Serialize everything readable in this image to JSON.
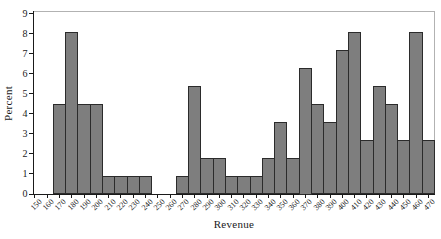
{
  "chart_data": {
    "type": "bar",
    "subtype": "histogram",
    "title": "",
    "xlabel": "Revenue",
    "ylabel": "Percent",
    "categories": [
      150,
      160,
      170,
      180,
      190,
      200,
      210,
      220,
      230,
      240,
      250,
      260,
      270,
      280,
      290,
      300,
      310,
      320,
      330,
      340,
      350,
      360,
      370,
      380,
      390,
      400,
      410,
      420,
      430,
      440,
      450,
      460,
      470
    ],
    "values": [
      0,
      0,
      4.46,
      8.04,
      4.46,
      4.46,
      0.89,
      0.89,
      0.89,
      0.89,
      0,
      0,
      0.89,
      5.36,
      1.79,
      1.79,
      0.89,
      0.89,
      0.89,
      1.79,
      3.57,
      1.79,
      6.25,
      4.46,
      3.57,
      7.14,
      8.04,
      2.68,
      5.36,
      4.46,
      2.68,
      8.04,
      2.68
    ],
    "bin_width": 10,
    "ylim": [
      0,
      9
    ],
    "yticks": [
      0,
      1,
      2,
      3,
      4,
      5,
      6,
      7,
      8,
      9
    ],
    "grid": false,
    "legend": "none",
    "colors": {
      "bar_fill": "#7e7e7e",
      "bar_border": "#2b2b2b",
      "axis": "#1a1a1a",
      "box_border": "#b2b2b2",
      "background": "#ffffff"
    }
  }
}
